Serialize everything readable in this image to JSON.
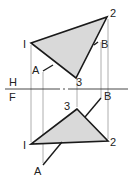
{
  "diagram": {
    "reference_line": {
      "top_label": "H",
      "bottom_label": "F"
    },
    "top_view": {
      "vertices": [
        {
          "label": "I",
          "x": 31,
          "y": 43
        },
        {
          "label": "2",
          "x": 107,
          "y": 17
        },
        {
          "label": "3",
          "x": 76,
          "y": 78
        }
      ],
      "line": {
        "a_label": "A",
        "b_label": "B"
      }
    },
    "front_view": {
      "vertices": [
        {
          "label": "3",
          "x": 77,
          "y": 109
        },
        {
          "label": "I",
          "x": 31,
          "y": 144
        },
        {
          "label": "2",
          "x": 108,
          "y": 141
        }
      ],
      "line": {
        "a_label": "A",
        "b_label": "B"
      }
    },
    "colors": {
      "fill": "#d9d9d9",
      "stroke": "#1a1a1a",
      "projector": "#999999"
    }
  }
}
